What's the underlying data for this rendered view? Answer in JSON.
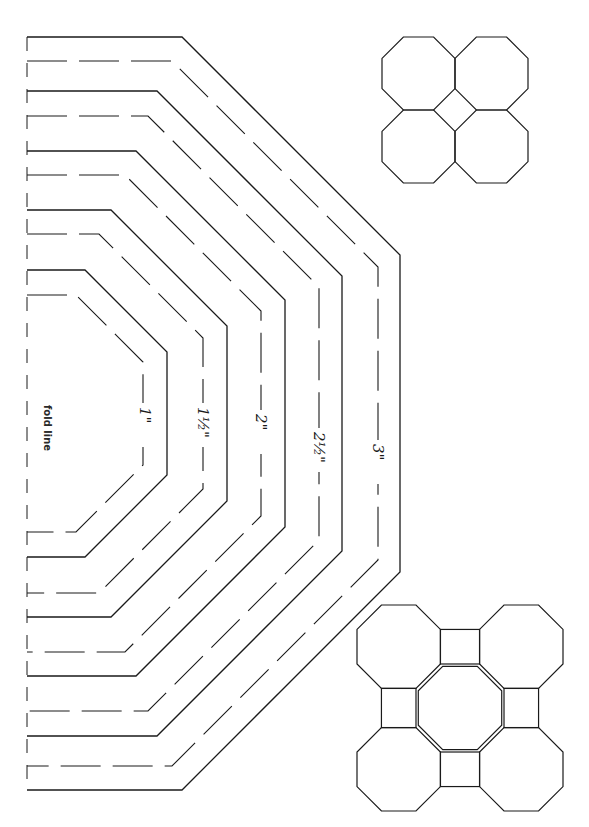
{
  "page": {
    "background": "#ffffff",
    "ink_color": "#1a1a1a"
  },
  "fold_line": {
    "label": "fold line",
    "x": 27,
    "y_top": 37,
    "y_bottom": 790
  },
  "templates": {
    "center_y": 413.5,
    "fold_x": 27,
    "sizes": [
      {
        "label": "1\"",
        "label_x": 145,
        "label_y": 425,
        "cut_line": {
          "top_y": 270,
          "corner_x": 85,
          "right_x": 167
        },
        "seam_line": {
          "top_y": 295,
          "corner_x": 76,
          "right_x": 143
        }
      },
      {
        "label": "1½\"",
        "label_x": 203,
        "label_y": 425,
        "cut_line": {
          "top_y": 210,
          "corner_x": 111,
          "right_x": 227
        },
        "seam_line": {
          "top_y": 234,
          "corner_x": 99,
          "right_x": 203
        }
      },
      {
        "label": "2\"",
        "label_x": 261,
        "label_y": 432,
        "cut_line": {
          "top_y": 151,
          "corner_x": 136,
          "right_x": 285
        },
        "seam_line": {
          "top_y": 175,
          "corner_x": 125,
          "right_x": 261
        }
      },
      {
        "label": "2½\"",
        "label_x": 319,
        "label_y": 450,
        "cut_line": {
          "top_y": 91,
          "corner_x": 157,
          "right_x": 342
        },
        "seam_line": {
          "top_y": 116,
          "corner_x": 148,
          "right_x": 319
        }
      },
      {
        "label": "3\"",
        "label_x": 378,
        "label_y": 462,
        "cut_line": {
          "top_y": 37,
          "corner_x": 182,
          "right_x": 400
        },
        "seam_line": {
          "top_y": 61,
          "corner_x": 172,
          "right_x": 378
        }
      }
    ]
  },
  "layout_diagrams": [
    {
      "name": "four-octagon-layout",
      "description": "Four octagons around a center square",
      "x": 382,
      "y": 37,
      "size": 146
    },
    {
      "name": "five-octagon-layout",
      "description": "Five octagons with four connecting squares",
      "x": 357,
      "y": 605,
      "size": 206
    }
  ]
}
